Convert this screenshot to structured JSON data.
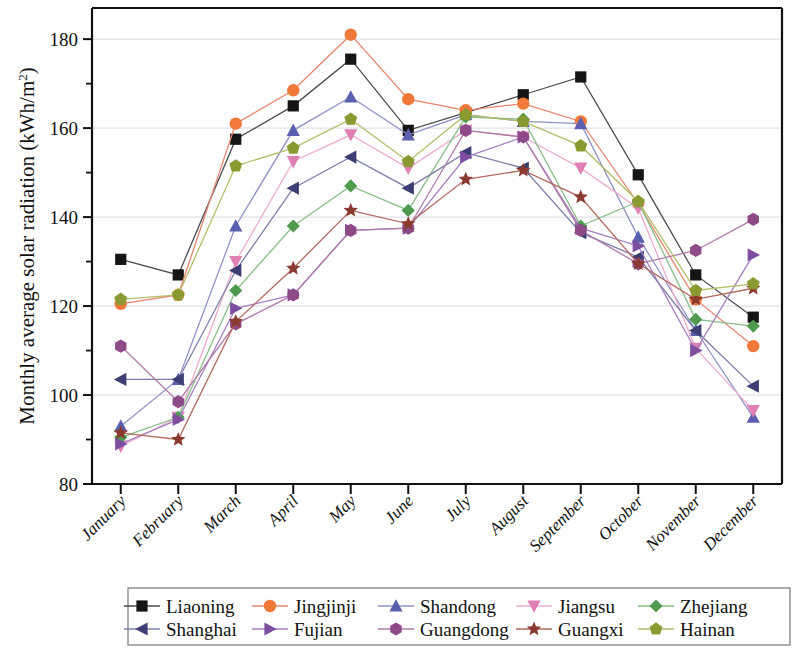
{
  "chart_data": {
    "type": "line",
    "title": "",
    "xlabel": "",
    "ylabel": "Monthly average solar radiation (kWh/m²)",
    "ylabel_parts": {
      "main": "Monthly average solar radiation (kWh/m",
      "sup": "2",
      "tail": ")"
    },
    "categories": [
      "January",
      "February",
      "March",
      "April",
      "May",
      "June",
      "July",
      "August",
      "September",
      "October",
      "November",
      "December"
    ],
    "ylim": [
      80,
      187
    ],
    "yticks": [
      80,
      100,
      120,
      140,
      160,
      180
    ],
    "yticks_minor": [
      90,
      110,
      130,
      150,
      170
    ],
    "grid": "horizontal-major",
    "legend_position": "bottom",
    "legend_columns": 5,
    "series": [
      {
        "name": "Liaoning",
        "marker": "square",
        "color": "#151515",
        "line_color": "#4b4b52",
        "values": [
          130.5,
          127.0,
          157.5,
          165.0,
          175.5,
          159.5,
          163.5,
          167.5,
          171.5,
          149.5,
          127.0,
          117.5
        ]
      },
      {
        "name": "Jingjinji",
        "marker": "circle",
        "color": "#f07838",
        "line_color": "#e8846b",
        "values": [
          120.5,
          122.5,
          161.0,
          168.5,
          181.0,
          166.5,
          164.0,
          165.5,
          161.5,
          143.0,
          121.5,
          111.0
        ]
      },
      {
        "name": "Shandong",
        "marker": "triangle-up",
        "color": "#5a5fb0",
        "line_color": "#8f93c8",
        "values": [
          93.0,
          103.5,
          138.0,
          159.5,
          167.0,
          158.5,
          163.0,
          161.5,
          161.0,
          135.5,
          114.5,
          95.0
        ]
      },
      {
        "name": "Jiangsu",
        "marker": "triangle-down",
        "color": "#e07fb4",
        "line_color": "#efacd0",
        "values": [
          88.5,
          95.0,
          130.0,
          152.5,
          158.5,
          151.0,
          159.5,
          158.0,
          151.0,
          142.0,
          110.5,
          96.5
        ]
      },
      {
        "name": "Zhejiang",
        "marker": "diamond",
        "color": "#4e9a4e",
        "line_color": "#86be86",
        "values": [
          90.5,
          95.0,
          123.5,
          138.0,
          147.0,
          141.5,
          162.5,
          162.0,
          138.0,
          143.5,
          117.0,
          115.5
        ]
      },
      {
        "name": "Shanghai",
        "marker": "triangle-left",
        "color": "#3d3f74",
        "line_color": "#7b7ea8",
        "values": [
          103.5,
          103.5,
          128.0,
          146.5,
          153.5,
          146.5,
          154.5,
          151.0,
          136.5,
          131.0,
          114.5,
          102.0
        ]
      },
      {
        "name": "Fujian",
        "marker": "triangle-right",
        "color": "#7e4fa0",
        "line_color": "#a67cc0",
        "values": [
          89.0,
          94.5,
          119.5,
          122.5,
          137.0,
          137.5,
          153.5,
          158.0,
          137.5,
          133.5,
          110.0,
          131.5
        ]
      },
      {
        "name": "Guangdong",
        "marker": "hexagon",
        "color": "#8e4a86",
        "line_color": "#b07bab",
        "values": [
          111.0,
          98.5,
          116.0,
          122.5,
          137.0,
          137.5,
          159.5,
          158.0,
          137.0,
          129.5,
          132.5,
          139.5
        ]
      },
      {
        "name": "Guangxi",
        "marker": "star",
        "color": "#8b3a30",
        "line_color": "#b56a5f",
        "values": [
          91.5,
          90.0,
          116.5,
          128.5,
          141.5,
          138.5,
          148.5,
          150.5,
          144.5,
          129.5,
          121.5,
          124.0
        ]
      },
      {
        "name": "Hainan",
        "marker": "pentagon",
        "color": "#8a9930",
        "line_color": "#b4bd6a",
        "values": [
          121.5,
          122.5,
          151.5,
          155.5,
          162.0,
          152.5,
          163.0,
          161.5,
          156.0,
          143.5,
          123.5,
          125.0
        ]
      }
    ]
  },
  "legend": {
    "row1": [
      "Liaoning",
      "Jingjinji",
      "Shandong",
      "Jiangsu",
      "Zhejiang"
    ],
    "row2": [
      "Shanghai",
      "Fujian",
      "Guangdong",
      "Guangxi",
      "Hainan"
    ]
  }
}
